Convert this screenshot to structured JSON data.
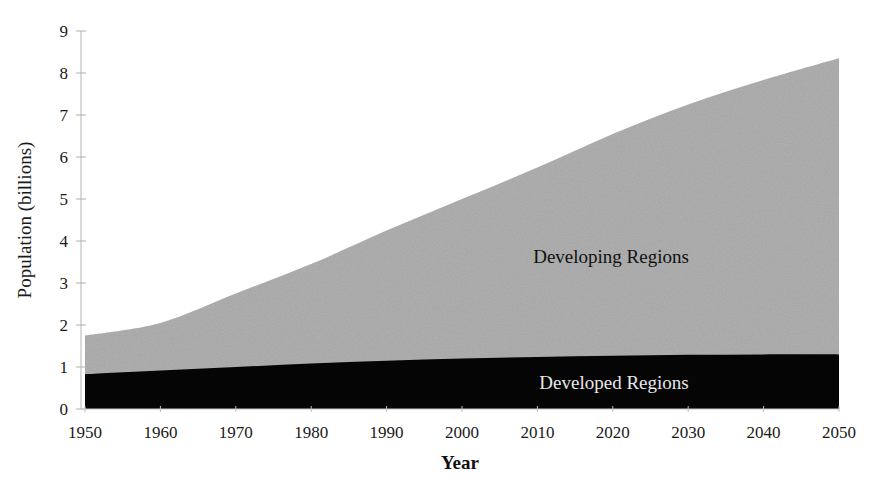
{
  "chart_data": {
    "type": "area",
    "stacked": true,
    "title": "",
    "xlabel": "Year",
    "ylabel": "Population (billions)",
    "x": [
      1950,
      1960,
      1970,
      1980,
      1990,
      2000,
      2010,
      2020,
      2030,
      2040,
      2050
    ],
    "xticks": [
      1950,
      1960,
      1970,
      1980,
      1990,
      2000,
      2010,
      2020,
      2030,
      2040,
      2050
    ],
    "yticks": [
      0,
      1,
      2,
      3,
      4,
      5,
      6,
      7,
      8,
      9
    ],
    "xlim": [
      1950,
      2050
    ],
    "ylim": [
      0,
      9
    ],
    "grid": false,
    "legend": "inline labels",
    "series": [
      {
        "name": "Developed Regions",
        "color": "#050505",
        "label_color": "#e8e8e8",
        "values": [
          0.83,
          0.92,
          1.0,
          1.08,
          1.15,
          1.2,
          1.24,
          1.27,
          1.29,
          1.3,
          1.3
        ]
      },
      {
        "name": "Developing Regions",
        "color": "#a8a8a8",
        "label_color": "#111111",
        "values": [
          0.92,
          1.13,
          1.75,
          2.37,
          3.1,
          3.8,
          4.51,
          5.28,
          5.96,
          6.53,
          7.05
        ]
      }
    ],
    "totals": [
      1.75,
      2.05,
      2.75,
      3.45,
      4.25,
      5.0,
      5.75,
      6.55,
      7.25,
      7.83,
      8.35
    ]
  },
  "labels": {
    "developing": "Developing Regions",
    "developed": "Developed Regions",
    "xlabel": "Year",
    "ylabel": "Population (billions)"
  }
}
